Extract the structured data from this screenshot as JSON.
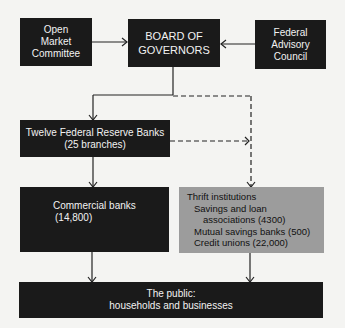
{
  "nodes": {
    "open_market": {
      "lines": [
        "Open",
        "Market",
        "Committee"
      ]
    },
    "board": {
      "lines": [
        "BOARD OF",
        "GOVERNORS"
      ]
    },
    "advisory": {
      "lines": [
        "Federal",
        "Advisory",
        "Council"
      ]
    },
    "reserve_banks": {
      "lines": [
        "Twelve Federal Reserve Banks",
        "(25 branches)"
      ]
    },
    "commercial": {
      "lines": [
        "Commercial banks",
        "(14,800)"
      ]
    },
    "thrift": {
      "lines": [
        "Thrift institutions",
        "Savings and loan",
        "associations (4300)",
        "Mutual savings banks (500)",
        "Credit unions (22,000)"
      ]
    },
    "public": {
      "lines": [
        "The public:",
        "households and businesses"
      ]
    }
  },
  "colors": {
    "dark_box": "#1a1a1a",
    "gray_box": "#9c9c9c",
    "line": "#222222",
    "background": "#f4f4f2"
  }
}
